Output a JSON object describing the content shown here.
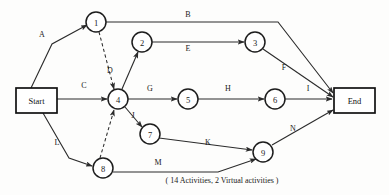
{
  "diagram": {
    "caption": "( 14 Activities, 2 Virtual activities )",
    "colors": {
      "stroke": "#2b2b2b",
      "node_stroke": "#1d1d1d",
      "background": "#fdfdfc",
      "text": "#1a1a1a"
    },
    "terminals": [
      {
        "id": "start",
        "label": "Start",
        "x": 16,
        "y": 88,
        "w": 41,
        "h": 25
      },
      {
        "id": "end",
        "label": "End",
        "x": 334,
        "y": 88,
        "w": 41,
        "h": 25
      }
    ],
    "nodes": [
      {
        "id": "n1",
        "label": "1",
        "cx": 96,
        "cy": 22,
        "r": 10
      },
      {
        "id": "n2",
        "label": "2",
        "cx": 142,
        "cy": 42,
        "r": 10
      },
      {
        "id": "n3",
        "label": "3",
        "cx": 255,
        "cy": 42,
        "r": 10
      },
      {
        "id": "n4",
        "label": "4",
        "cx": 118,
        "cy": 99,
        "r": 10
      },
      {
        "id": "n5",
        "label": "5",
        "cx": 188,
        "cy": 99,
        "r": 10
      },
      {
        "id": "n6",
        "label": "6",
        "cx": 275,
        "cy": 99,
        "r": 10
      },
      {
        "id": "n7",
        "label": "7",
        "cx": 150,
        "cy": 134,
        "r": 10
      },
      {
        "id": "n8",
        "label": "8",
        "cx": 103,
        "cy": 168,
        "r": 10
      },
      {
        "id": "n9",
        "label": "9",
        "cx": 263,
        "cy": 152,
        "r": 10
      }
    ],
    "edges": [
      {
        "id": "A",
        "label": "A",
        "from": "start",
        "to": "n1",
        "virtual": false,
        "points": "31,88 52,44 87,25",
        "label_x": 42,
        "label_y": 34
      },
      {
        "id": "B",
        "label": "B",
        "from": "n1",
        "to": "end",
        "virtual": false,
        "points": "106,22 278,22 333,93",
        "label_x": 188,
        "label_y": 14
      },
      {
        "id": "C",
        "label": "C",
        "from": "start",
        "to": "n4",
        "virtual": false,
        "points": "57,99 107,99",
        "label_x": 84,
        "label_y": 85
      },
      {
        "id": "D",
        "label": "D",
        "from": "n4",
        "to": "n2",
        "virtual": false,
        "points": "122,89 138,52",
        "label_x": 110,
        "label_y": 70
      },
      {
        "id": "E",
        "label": "E",
        "from": "n2",
        "to": "n3",
        "virtual": false,
        "points": "152,42 244,42",
        "label_x": 188,
        "label_y": 48
      },
      {
        "id": "F",
        "label": "F",
        "from": "n3",
        "to": "end",
        "virtual": false,
        "points": "263,49 333,97",
        "label_x": 284,
        "label_y": 67
      },
      {
        "id": "G",
        "label": "G",
        "from": "n4",
        "to": "n5",
        "virtual": false,
        "points": "128,99 177,99",
        "label_x": 150,
        "label_y": 88
      },
      {
        "id": "H",
        "label": "H",
        "from": "n5",
        "to": "n6",
        "virtual": false,
        "points": "198,99 264,99",
        "label_x": 228,
        "label_y": 88
      },
      {
        "id": "I",
        "label": "I",
        "from": "n6",
        "to": "end",
        "virtual": false,
        "points": "285,99 332,99",
        "label_x": 308,
        "label_y": 88
      },
      {
        "id": "J",
        "label": "J",
        "from": "n4",
        "to": "n7",
        "virtual": false,
        "points": "125,107 142,127",
        "label_x": 133,
        "label_y": 115
      },
      {
        "id": "K",
        "label": "K",
        "from": "n7",
        "to": "n9",
        "virtual": false,
        "points": "159,138 252,150",
        "label_x": 208,
        "label_y": 142
      },
      {
        "id": "L",
        "label": "L",
        "from": "start",
        "to": "n8",
        "virtual": false,
        "points": "43,113 69,158 92,166",
        "label_x": 57,
        "label_y": 142
      },
      {
        "id": "M",
        "label": "M",
        "from": "n8",
        "to": "n9",
        "virtual": false,
        "points": "113,172 218,172 256,159",
        "label_x": 158,
        "label_y": 162
      },
      {
        "id": "N",
        "label": "N",
        "from": "n9",
        "to": "end",
        "virtual": false,
        "points": "272,145 333,110",
        "label_x": 293,
        "label_y": 128
      },
      {
        "id": "V1",
        "label": "",
        "from": "n1",
        "to": "n4",
        "virtual": true,
        "points": "99,32 114,89",
        "label_x": 0,
        "label_y": 0
      },
      {
        "id": "V2",
        "label": "",
        "from": "n8",
        "to": "n4",
        "virtual": true,
        "points": "100,158 114,110",
        "label_x": 0,
        "label_y": 0
      }
    ]
  }
}
